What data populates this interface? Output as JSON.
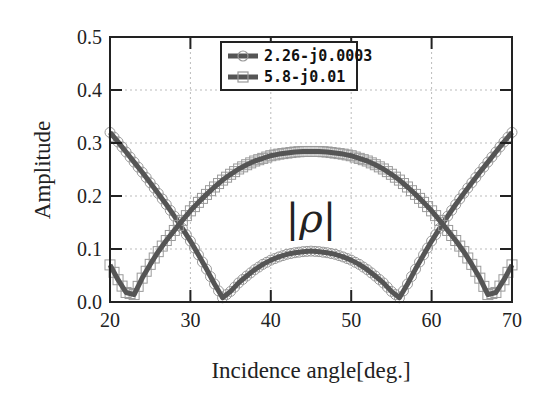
{
  "chart_data": {
    "type": "line",
    "title": "",
    "xlabel": "Incidence angle[deg.]",
    "ylabel": "Amplitude",
    "xlim": [
      20,
      70
    ],
    "ylim": [
      0.0,
      0.5
    ],
    "xticks": [
      "20",
      "30",
      "40",
      "50",
      "60",
      "70"
    ],
    "yticks": [
      "0.0",
      "0.1",
      "0.2",
      "0.3",
      "0.4",
      "0.5"
    ],
    "grid": true,
    "legend_position": "upper center",
    "annotation": "|ρ|",
    "x": [
      20,
      21,
      22,
      23,
      24,
      25,
      26,
      27,
      28,
      29,
      30,
      31,
      32,
      33,
      34,
      35,
      36,
      37,
      38,
      39,
      40,
      41,
      42,
      43,
      44,
      45,
      46,
      47,
      48,
      49,
      50,
      51,
      52,
      53,
      54,
      55,
      56,
      57,
      58,
      59,
      60,
      61,
      62,
      63,
      64,
      65,
      66,
      67,
      68,
      69,
      70
    ],
    "series": [
      {
        "name": "2.26-j0.0003",
        "marker": "circle",
        "values": [
          0.32,
          0.302,
          0.283,
          0.264,
          0.245,
          0.225,
          0.205,
          0.184,
          0.162,
          0.139,
          0.115,
          0.089,
          0.062,
          0.034,
          0.008,
          0.02,
          0.036,
          0.049,
          0.061,
          0.071,
          0.079,
          0.085,
          0.09,
          0.093,
          0.095,
          0.096,
          0.095,
          0.093,
          0.09,
          0.085,
          0.079,
          0.071,
          0.061,
          0.049,
          0.036,
          0.02,
          0.008,
          0.034,
          0.062,
          0.089,
          0.115,
          0.139,
          0.162,
          0.184,
          0.205,
          0.225,
          0.245,
          0.264,
          0.283,
          0.302,
          0.32
        ]
      },
      {
        "name": "5.8-j0.01",
        "marker": "square",
        "values": [
          0.07,
          0.042,
          0.018,
          0.014,
          0.045,
          0.071,
          0.095,
          0.116,
          0.135,
          0.154,
          0.172,
          0.188,
          0.203,
          0.217,
          0.23,
          0.241,
          0.251,
          0.259,
          0.266,
          0.271,
          0.276,
          0.279,
          0.281,
          0.283,
          0.284,
          0.284,
          0.284,
          0.283,
          0.281,
          0.279,
          0.276,
          0.271,
          0.266,
          0.259,
          0.251,
          0.241,
          0.23,
          0.217,
          0.203,
          0.188,
          0.172,
          0.154,
          0.135,
          0.116,
          0.095,
          0.071,
          0.045,
          0.014,
          0.018,
          0.042,
          0.07
        ]
      }
    ]
  },
  "colors": {
    "line": "#555555",
    "marker": "#999999",
    "axis": "#222222",
    "grid": "#bbbbbb"
  }
}
